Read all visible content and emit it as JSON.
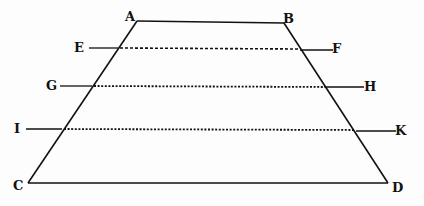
{
  "diagram": {
    "type": "geometric-figure",
    "colors": {
      "ink": "#111111",
      "paper": "#fdfdfd"
    },
    "points": {
      "A": {
        "label": "A",
        "x": 137,
        "y": 21
      },
      "B": {
        "label": "B",
        "x": 284,
        "y": 23
      },
      "C": {
        "label": "C",
        "x": 28,
        "y": 183
      },
      "D": {
        "label": "D",
        "x": 388,
        "y": 183
      }
    },
    "parallels": [
      {
        "left_label": "E",
        "right_label": "F",
        "y": 48
      },
      {
        "left_label": "G",
        "right_label": "H",
        "y": 86
      },
      {
        "left_label": "I",
        "right_label": "K",
        "y": 129
      }
    ],
    "labels": {
      "A": "A",
      "B": "B",
      "C": "C",
      "D": "D",
      "E": "E",
      "F": "F",
      "G": "G",
      "H": "H",
      "I": "I",
      "K": "K"
    }
  }
}
